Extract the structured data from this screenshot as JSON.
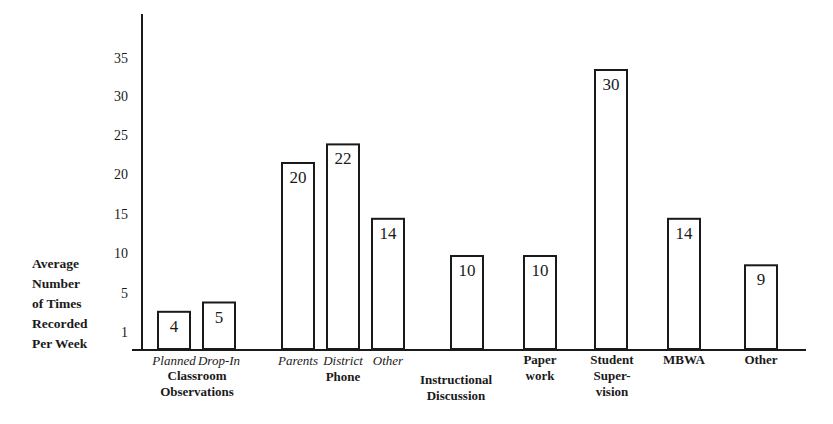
{
  "chart_data": {
    "type": "bar",
    "title": "",
    "xlabel": "",
    "ylabel": [
      "Average",
      "Number",
      "of Times",
      "Recorded",
      "Per Week"
    ],
    "yticks": [
      "1",
      "5",
      "10",
      "15",
      "20",
      "25",
      "30",
      "35"
    ],
    "ylim": [
      0,
      37
    ],
    "grid": false,
    "legend": "none",
    "bars": [
      {
        "sub_label": "Planned",
        "group": "Classroom Observations",
        "value": 4
      },
      {
        "sub_label": "Drop-In",
        "group": "Classroom Observations",
        "value": 5
      },
      {
        "sub_label": "Parents",
        "group": "Phone",
        "value": 20
      },
      {
        "sub_label": "District",
        "group": "Phone",
        "value": 22
      },
      {
        "sub_label": "Other",
        "group": "Phone",
        "value": 14
      },
      {
        "sub_label": "",
        "group": "Instructional Discussion",
        "value": 10
      },
      {
        "sub_label": "",
        "group": "Paper work",
        "value": 10
      },
      {
        "sub_label": "",
        "group": "Student Super- vision",
        "value": 30
      },
      {
        "sub_label": "",
        "group": "MBWA",
        "value": 14
      },
      {
        "sub_label": "",
        "group": "Other",
        "value": 9
      }
    ],
    "group_labels": [
      {
        "name": "Classroom Observations",
        "lines": [
          "Classroom",
          "Observations"
        ]
      },
      {
        "name": "Phone",
        "lines": [
          "Phone"
        ]
      },
      {
        "name": "Instructional Discussion",
        "lines": [
          "Instructional",
          "Discussion"
        ]
      },
      {
        "name": "Paper work",
        "lines": [
          "Paper",
          "work"
        ]
      },
      {
        "name": "Student Super- vision",
        "lines": [
          "Student",
          "Super-",
          "vision"
        ]
      },
      {
        "name": "MBWA",
        "lines": [
          "MBWA"
        ]
      },
      {
        "name": "Other",
        "lines": [
          "Other"
        ]
      }
    ]
  }
}
